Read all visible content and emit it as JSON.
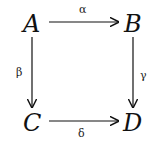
{
  "diagram": {
    "type": "commutative-square",
    "nodes": {
      "A": "A",
      "B": "B",
      "C": "C",
      "D": "D"
    },
    "arrows": [
      {
        "from": "A",
        "to": "B",
        "label": "α"
      },
      {
        "from": "A",
        "to": "C",
        "label": "β"
      },
      {
        "from": "B",
        "to": "D",
        "label": "γ"
      },
      {
        "from": "C",
        "to": "D",
        "label": "δ"
      }
    ],
    "colors": {
      "ink": "#111111",
      "background": "#ffffff"
    }
  }
}
